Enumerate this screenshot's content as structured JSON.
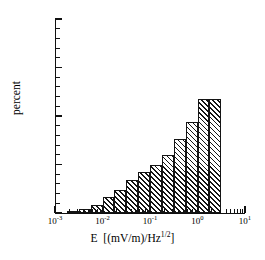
{
  "chart_data": {
    "type": "bar",
    "title": "",
    "subtitle": "",
    "xlabel_plain": "E  [(mV/m)/Hz^1/2]",
    "xlabel_parts": {
      "symbol": "E",
      "bracket_open": "[(mV/m)/Hz",
      "exponent": "1/2",
      "bracket_close": "]"
    },
    "ylabel": "percent",
    "xscale": "log",
    "yscale": "linear",
    "xlim": [
      0.001,
      10
    ],
    "ylim": [
      0,
      100
    ],
    "grid": false,
    "legend": null,
    "bar_width_decades": 0.25,
    "x_tick_labels": [
      {
        "base": "10",
        "exp": "-3",
        "value": 0.001
      },
      {
        "base": "10",
        "exp": "-2",
        "value": 0.01
      },
      {
        "base": "10",
        "exp": "-1",
        "value": 0.1
      },
      {
        "base": "10",
        "exp": "0",
        "value": 1
      },
      {
        "base": "10",
        "exp": "1",
        "value": 10
      }
    ],
    "y_tick_labels": [
      "0",
      "25",
      "50",
      "75",
      "100"
    ],
    "y_tick_values": [
      0,
      25,
      50,
      75,
      100
    ],
    "y_minor_step": 5,
    "categories": [
      "10^-2.75",
      "10^-2.5",
      "10^-2.25",
      "10^-2",
      "10^-1.75",
      "10^-1.5",
      "10^-1.25",
      "10^-1",
      "10^-0.75",
      "10^-0.5",
      "10^-0.25",
      "10^0",
      "10^0.25"
    ],
    "bin_left_log10": [
      -2.75,
      -2.5,
      -2.25,
      -2.0,
      -1.75,
      -1.5,
      -1.25,
      -1.0,
      -0.75,
      -0.5,
      -0.25,
      0.0,
      0.25
    ],
    "values": [
      1,
      2,
      4,
      8,
      12,
      17,
      21,
      25,
      30,
      38,
      47,
      59,
      59
    ],
    "max_value": 59,
    "colors": {
      "bar_edge": "#141414",
      "bar_hatch": "#141414",
      "bar_fill": "#ffffff",
      "axis": "#111111",
      "text": "#000000",
      "background": "#ffffff"
    }
  }
}
